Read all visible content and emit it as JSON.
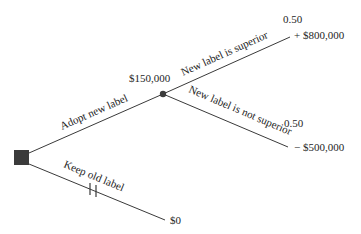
{
  "diagram": {
    "type": "decision-tree",
    "decision_node": {
      "shape": "square",
      "color": "#3b3b3b"
    },
    "chance_node": {
      "shape": "circle",
      "color": "#3b3b3b",
      "expected_value": "$150,000"
    },
    "branches": {
      "adopt": {
        "label": "Adopt new label"
      },
      "keep": {
        "label": "Keep old label",
        "pruned": true,
        "payoff": "$0"
      },
      "superior": {
        "label": "New label is superior",
        "probability": "0.50",
        "payoff": "+ $800,000"
      },
      "not_superior": {
        "label": "New label is not superior",
        "probability": "0.50",
        "payoff": "− $500,000"
      }
    }
  }
}
